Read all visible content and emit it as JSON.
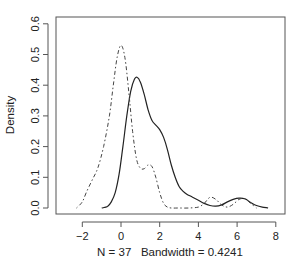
{
  "chart_data": {
    "type": "line",
    "title": "",
    "xlabel": "N = 37   Bandwidth = 0.4241",
    "ylabel": "Density",
    "xlim": [
      -3.1,
      8.4
    ],
    "ylim": [
      -0.018,
      0.63
    ],
    "xticks": [
      -2,
      0,
      2,
      4,
      6,
      8
    ],
    "xtick_labels": [
      "−2",
      "0",
      "2",
      "4",
      "6",
      "8"
    ],
    "yticks": [
      0.0,
      0.1,
      0.2,
      0.3,
      0.4,
      0.5,
      0.6
    ],
    "ytick_labels": [
      "0.0",
      "0.1",
      "0.2",
      "0.3",
      "0.4",
      "0.5",
      "0.6"
    ],
    "grid": false,
    "legend": null,
    "series": [
      {
        "name": "density-solid",
        "line_style": "solid",
        "color": "#222222",
        "x": [
          -1.0,
          -0.7,
          -0.5,
          -0.3,
          -0.1,
          0.1,
          0.3,
          0.5,
          0.7,
          0.85,
          1.0,
          1.2,
          1.4,
          1.6,
          1.8,
          2.0,
          2.2,
          2.4,
          2.6,
          2.8,
          3.0,
          3.2,
          3.4,
          3.7,
          4.0,
          4.3,
          4.6,
          4.9,
          5.2,
          5.5,
          5.8,
          6.1,
          6.4,
          6.7,
          7.0,
          7.3,
          7.6
        ],
        "y": [
          0.0,
          0.005,
          0.02,
          0.05,
          0.11,
          0.2,
          0.3,
          0.38,
          0.42,
          0.425,
          0.41,
          0.37,
          0.32,
          0.285,
          0.27,
          0.255,
          0.23,
          0.19,
          0.14,
          0.1,
          0.07,
          0.055,
          0.045,
          0.035,
          0.025,
          0.015,
          0.008,
          0.006,
          0.01,
          0.02,
          0.028,
          0.032,
          0.03,
          0.018,
          0.008,
          0.003,
          0.0
        ]
      },
      {
        "name": "density-dashed",
        "line_style": "dotdash",
        "color": "#444444",
        "x": [
          -2.3,
          -2.0,
          -1.8,
          -1.5,
          -1.2,
          -0.9,
          -0.6,
          -0.4,
          -0.2,
          0.0,
          0.2,
          0.4,
          0.6,
          0.8,
          1.0,
          1.2,
          1.4,
          1.6,
          1.8,
          2.0,
          2.2,
          2.4,
          2.6,
          3.0,
          3.5,
          4.0,
          4.3,
          4.6,
          4.9,
          5.2,
          5.5,
          5.8,
          6.1,
          6.4,
          6.7,
          7.0
        ],
        "y": [
          0.0,
          0.02,
          0.05,
          0.09,
          0.13,
          0.2,
          0.3,
          0.4,
          0.49,
          0.53,
          0.49,
          0.38,
          0.25,
          0.16,
          0.13,
          0.128,
          0.14,
          0.135,
          0.1,
          0.05,
          0.015,
          0.003,
          0.0,
          0.0,
          0.0,
          0.003,
          0.015,
          0.035,
          0.028,
          0.01,
          0.003,
          0.012,
          0.028,
          0.03,
          0.015,
          0.0
        ]
      }
    ],
    "annotations": []
  },
  "axes": {
    "ylabel": "Density",
    "xlabel": "N = 37   Bandwidth = 0.4241"
  }
}
